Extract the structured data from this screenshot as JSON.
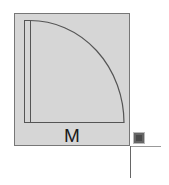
{
  "diagram": {
    "type": "door-swing-symbol",
    "label": "M",
    "colors": {
      "fill": "#d6d6d6",
      "stroke": "#555555",
      "border": "#777777",
      "handle": "#4a4a4a",
      "guide": "#999999"
    },
    "shapes": {
      "block": {
        "x": 14,
        "y": 13,
        "width": 116,
        "height": 133
      },
      "door_leaf": {
        "x": 24,
        "y": 20,
        "width": 6,
        "height": 103
      },
      "swing_arc": {
        "cx": 30,
        "cy": 123,
        "radius": 94
      },
      "handle": {
        "x": 134,
        "y": 133,
        "size": 10
      },
      "guide_horizontal": {
        "x1": 130,
        "x2": 161,
        "y": 146
      },
      "guide_vertical": {
        "x": 130,
        "y1": 146,
        "y2": 178
      }
    }
  }
}
